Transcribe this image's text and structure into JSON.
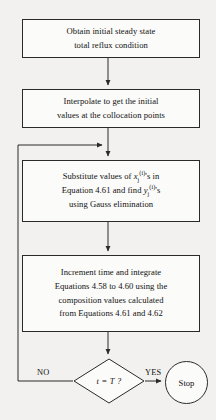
{
  "diagram": {
    "type": "flowchart",
    "nodes": {
      "start_box": {
        "shape": "rectangle",
        "lines": [
          "Obtain initial steady state",
          "total reflux condition"
        ]
      },
      "interpolate_box": {
        "shape": "rectangle",
        "lines": [
          "Interpolate to get the initial",
          "values at the collocation points"
        ]
      },
      "substitute_box": {
        "shape": "rectangle",
        "line1_prefix": "Substitute values of ",
        "line1_var": "x",
        "line1_sub": "j",
        "line1_sup": "(i)",
        "line1_suffix": "'s in",
        "line2_prefix": "Equation 4.61 and find ",
        "line2_var": "y",
        "line2_sub": "j",
        "line2_sup": "(i)",
        "line2_suffix": "'s",
        "line3": "using Gauss elimination"
      },
      "increment_box": {
        "shape": "rectangle",
        "lines": [
          "Increment time and integrate",
          "Equations 4.58 to 4.60 using the",
          "composition values calculated",
          "from Equations 4.61 and 4.62"
        ]
      },
      "decision": {
        "shape": "diamond",
        "label": "t = T ?"
      },
      "stop": {
        "shape": "circle",
        "label": "Stop"
      }
    },
    "edge_labels": {
      "no": "NO",
      "yes": "YES"
    },
    "colors": {
      "background": "#f2f1ef",
      "node_fill": "#fbfbfa",
      "stroke": "#2a2a2a",
      "text": "#111111"
    }
  }
}
